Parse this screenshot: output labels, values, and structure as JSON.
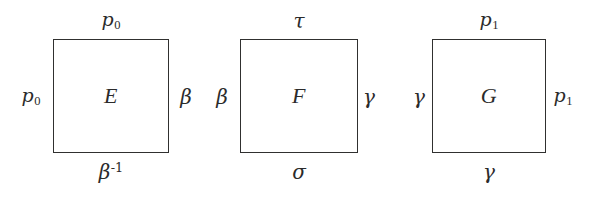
{
  "figure": {
    "kind": "math-diagram",
    "ink_color": "#2b2b2b",
    "background_color": "#ffffff",
    "squares": [
      {
        "id": "square-E",
        "center_label": "E",
        "top_label": "p₀",
        "top_label_parts": {
          "base": "p",
          "sub": "0"
        },
        "left_label": "p₀",
        "left_label_parts": {
          "base": "p",
          "sub": "0"
        },
        "right_label": "β",
        "bottom_label": "β⁻¹",
        "bottom_label_parts": {
          "base": "β",
          "sup": "-1"
        }
      },
      {
        "id": "square-F",
        "center_label": "F",
        "top_label": "τ",
        "left_label": "β",
        "right_label": "γ",
        "bottom_label": "σ"
      },
      {
        "id": "square-G",
        "center_label": "G",
        "top_label": "p₁",
        "top_label_parts": {
          "base": "p",
          "sub": "1"
        },
        "left_label": "γ",
        "right_label": "p₁",
        "right_label_parts": {
          "base": "p",
          "sub": "1"
        },
        "bottom_label": "γ"
      }
    ]
  }
}
